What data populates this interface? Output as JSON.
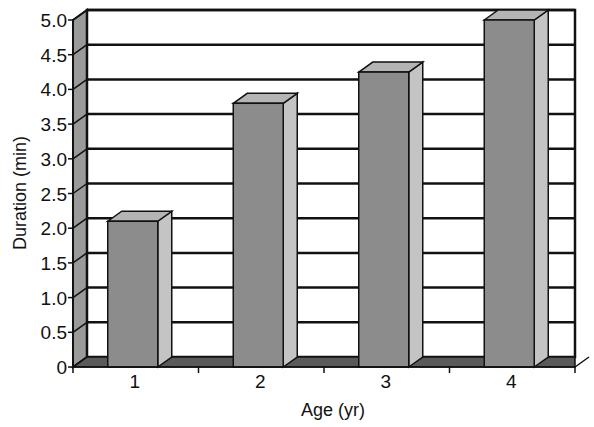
{
  "chart_data": {
    "type": "bar",
    "style": "3d-column",
    "title": "",
    "xlabel": "Age (yr)",
    "ylabel": "Duration (min)",
    "categories": [
      "1",
      "2",
      "3",
      "4"
    ],
    "values": [
      2.1,
      3.8,
      4.25,
      5.0
    ],
    "ylim": [
      0,
      5.0
    ],
    "yticks": [
      "0",
      "0.5",
      "1.0",
      "1.5",
      "2.0",
      "2.5",
      "3.0",
      "3.5",
      "4.0",
      "4.5",
      "5.0"
    ],
    "grid": true,
    "legend": null,
    "colors": {
      "bar_front": "#8c8c8c",
      "bar_side": "#c4c4c4",
      "bar_top": "#b4b4b4",
      "floor": "#5a5a5a",
      "left_wall": "#9a9a9a",
      "gridline": "#111111",
      "background": "#ffffff"
    }
  }
}
